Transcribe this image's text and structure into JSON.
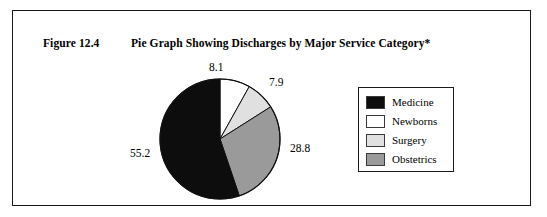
{
  "figure": {
    "number_label": "Figure 12.4",
    "title": "Pie Graph Showing Discharges by Major Service Category*"
  },
  "legend": {
    "items": [
      {
        "label": "Medicine",
        "color": "#0d0d0d"
      },
      {
        "label": "Newborns",
        "color": "#ffffff"
      },
      {
        "label": "Surgery",
        "color": "#e0e0e0"
      },
      {
        "label": "Obstetrics",
        "color": "#9a9a9a"
      }
    ]
  },
  "chart_data": {
    "type": "pie",
    "title": "Pie Graph Showing Discharges by Major Service Category*",
    "labels": [
      "Newborns",
      "Surgery",
      "Obstetrics",
      "Medicine"
    ],
    "values": [
      8.1,
      7.9,
      28.8,
      55.2
    ],
    "colors": [
      "#ffffff",
      "#e0e0e0",
      "#9a9a9a",
      "#0d0d0d"
    ],
    "value_labels": [
      "8.1",
      "7.9",
      "28.8",
      "55.2"
    ],
    "start_angle_deg": 0,
    "direction": "clockwise",
    "units": "percent",
    "legend_position": "right",
    "grid": false
  }
}
